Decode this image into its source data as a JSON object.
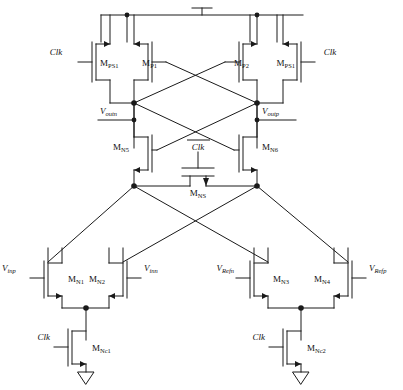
{
  "figure": {
    "type": "circuit-schematic",
    "stroke_color": "#1a1a1a",
    "background_color": "#ffffff",
    "width": 403,
    "height": 390
  },
  "power": {
    "vdd_symbol": "vdd-bar",
    "ground_symbol": "triangle-ground",
    "ground_count": 2
  },
  "transistors": [
    {
      "id": "MPS1L",
      "name": "M",
      "sub": "PS1",
      "type": "pmos",
      "gate_signal": "Clk"
    },
    {
      "id": "MP1",
      "name": "M",
      "sub": "P1",
      "type": "pmos",
      "gate_signal": "Voutp"
    },
    {
      "id": "MP2",
      "name": "M",
      "sub": "P2",
      "type": "pmos",
      "gate_signal": "Voutn"
    },
    {
      "id": "MPS1R",
      "name": "M",
      "sub": "PS1",
      "type": "pmos",
      "gate_signal": "Clk"
    },
    {
      "id": "MN5",
      "name": "M",
      "sub": "N5",
      "type": "nmos",
      "gate_signal": "Voutp"
    },
    {
      "id": "MN6",
      "name": "M",
      "sub": "N6",
      "type": "nmos",
      "gate_signal": "Voutn"
    },
    {
      "id": "MNS",
      "name": "M",
      "sub": "NS",
      "type": "nmos",
      "gate_signal": "Clk-bar"
    },
    {
      "id": "MN1",
      "name": "M",
      "sub": "N1",
      "type": "nmos",
      "gate_signal": "Vinp"
    },
    {
      "id": "MN2",
      "name": "M",
      "sub": "N2",
      "type": "nmos",
      "gate_signal": "Vinn"
    },
    {
      "id": "MN3",
      "name": "M",
      "sub": "N3",
      "type": "nmos",
      "gate_signal": "VRefn"
    },
    {
      "id": "MN4",
      "name": "M",
      "sub": "N4",
      "type": "nmos",
      "gate_signal": "VRefp"
    },
    {
      "id": "MNC1",
      "name": "M",
      "sub": "Nc1",
      "type": "nmos",
      "gate_signal": "Clk"
    },
    {
      "id": "MNC2",
      "name": "M",
      "sub": "Nc2",
      "type": "nmos",
      "gate_signal": "Clk"
    }
  ],
  "labels": {
    "clk_top_left": {
      "text": "Clk",
      "overbar": false
    },
    "clk_top_right": {
      "text": "Clk",
      "overbar": false
    },
    "clk_bar_mid": {
      "text": "Clk",
      "overbar": true
    },
    "clk_bottom_left": {
      "text": "Clk",
      "overbar": false
    },
    "clk_bottom_right": {
      "text": "Clk",
      "overbar": false
    },
    "voutn": {
      "base": "V",
      "sub": "outn"
    },
    "voutp": {
      "base": "V",
      "sub": "outp"
    },
    "vinp": {
      "base": "V",
      "sub": "inp"
    },
    "vinn": {
      "base": "V",
      "sub": "inn"
    },
    "vrefn": {
      "base": "V",
      "sub": "Refn"
    },
    "vrefp": {
      "base": "V",
      "sub": "Refp"
    },
    "mps1_left": {
      "base": "M",
      "sub": "PS1"
    },
    "mp1": {
      "base": "M",
      "sub": "P1"
    },
    "mp2": {
      "base": "M",
      "sub": "P2"
    },
    "mps1_right": {
      "base": "M",
      "sub": "PS1"
    },
    "mn5": {
      "base": "M",
      "sub": "N5"
    },
    "mn6": {
      "base": "M",
      "sub": "N6"
    },
    "mns": {
      "base": "M",
      "sub": "NS"
    },
    "mn1": {
      "base": "M",
      "sub": "N1"
    },
    "mn2": {
      "base": "M",
      "sub": "N2"
    },
    "mn3": {
      "base": "M",
      "sub": "N3"
    },
    "mn4": {
      "base": "M",
      "sub": "N4"
    },
    "mnc1": {
      "base": "M",
      "sub": "Nc1"
    },
    "mnc2": {
      "base": "M",
      "sub": "Nc2"
    }
  },
  "nodes": {
    "voutn_node": "left output node",
    "voutp_node": "right output node",
    "tail_left": "left tail node",
    "tail_right": "right tail node"
  }
}
